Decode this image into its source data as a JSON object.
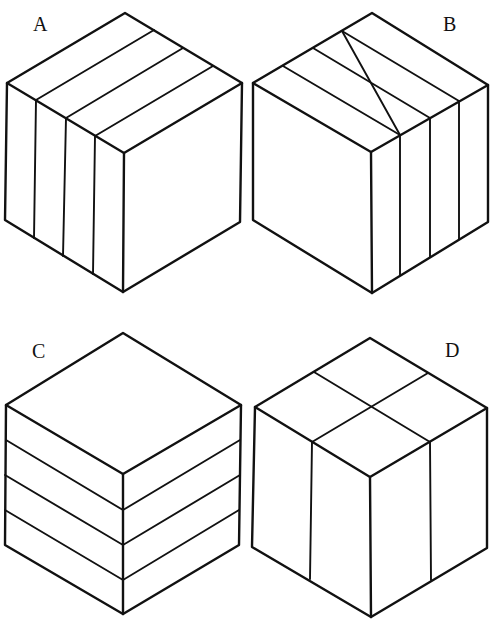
{
  "figure": {
    "line_color": "#111111",
    "background": "#ffffff"
  },
  "cubes": [
    {
      "label": "A",
      "division": "four vertical slices parallel to the right face (lines on top and left faces)"
    },
    {
      "label": "B",
      "division": "four vertical slices parallel to the left face (lines on top and right faces)"
    },
    {
      "label": "C",
      "division": "four horizontal layers (lines on left and right faces)"
    },
    {
      "label": "D",
      "division": "four vertical quarter columns (cross on top, one line on each side face)"
    }
  ]
}
